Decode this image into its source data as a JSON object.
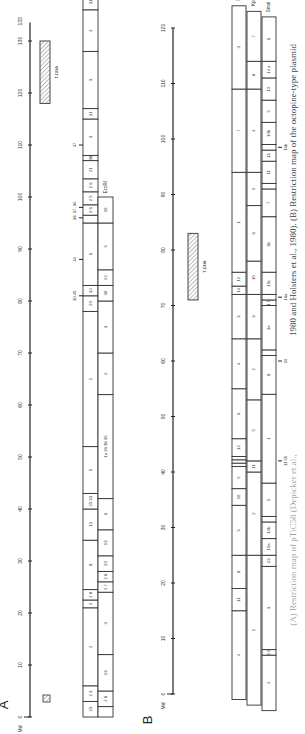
{
  "figure": {
    "orientation": "rotated-90-ccw",
    "caption": "1980 and Holsters et al., 1980). (B) Restriction map of the octopine-type plasmid",
    "caption_lower": "(A) Restriction map of pTiC58 (Depicker et al.,",
    "unit_label": "Md",
    "panels": {
      "A": {
        "label": "A",
        "axis": {
          "min": 0,
          "max": 133,
          "ticks": [
            0,
            10,
            20,
            30,
            40,
            50,
            60,
            70,
            80,
            90,
            100,
            110,
            120,
            130
          ],
          "end_label": "133",
          "zero_y": 717,
          "px_per_unit": 5.2,
          "x": 30
        },
        "tdna": {
          "label": "T-DNA",
          "start": 118,
          "end": 130
        },
        "legend_hatch": true,
        "enzymes": [
          {
            "name": "HindIII",
            "x": 83,
            "w": 15,
            "fragments": [
              {
                "s": 0,
                "e": 3,
                "l": "23"
              },
              {
                "s": 3,
                "e": 6,
                "l": "2 3"
              },
              {
                "s": 6,
                "e": 21,
                "l": "2"
              },
              {
                "s": 21,
                "e": 22.5,
                "l": "2"
              },
              {
                "s": 22.5,
                "e": 24.5,
                "l": "2 8"
              },
              {
                "s": 24.5,
                "e": 34,
                "l": "8"
              },
              {
                "s": 34,
                "e": 40,
                "l": "13"
              },
              {
                "s": 40,
                "e": 43,
                "l": "25 33"
              },
              {
                "s": 43,
                "e": 52,
                "l": "5"
              },
              {
                "s": 52,
                "e": 78,
                "l": "1"
              },
              {
                "s": 78,
                "e": 81,
                "l": "20"
              },
              {
                "s": 81,
                "e": 83,
                "l": "34"
              },
              {
                "s": 83,
                "e": 95,
                "l": "6"
              },
              {
                "s": 95,
                "e": 96.5,
                "l": ""
              },
              {
                "s": 96.5,
                "e": 98.5,
                "l": "2 6"
              },
              {
                "s": 98.5,
                "e": 101,
                "l": "2 5"
              },
              {
                "s": 101,
                "e": 103.5,
                "l": "2 6"
              },
              {
                "s": 103.5,
                "e": 107,
                "l": "21"
              },
              {
                "s": 107,
                "e": 108,
                "l": "38"
              },
              {
                "s": 108,
                "e": 115,
                "l": "3"
              },
              {
                "s": 115,
                "e": 117,
                "l": "31"
              },
              {
                "s": 117,
                "e": 128,
                "l": "3"
              },
              {
                "s": 128,
                "e": 136,
                "l": "4"
              },
              {
                "s": 136,
                "e": 139,
                "l": "31"
              },
              {
                "s": 139,
                "e": 142,
                "l": ""
              }
            ]
          },
          {
            "name": "EcoRI",
            "x": 98,
            "w": 15,
            "fragments": [
              {
                "s": 0,
                "e": 2,
                "l": ""
              },
              {
                "s": 2,
                "e": 5,
                "l": "2 8"
              },
              {
                "s": 5,
                "e": 12,
                "l": "13"
              },
              {
                "s": 12,
                "e": 24,
                "l": "3"
              },
              {
                "s": 24,
                "e": 26,
                "l": "2 7"
              },
              {
                "s": 26,
                "e": 28,
                "l": "2 8"
              },
              {
                "s": 28,
                "e": 31,
                "l": "20"
              },
              {
                "s": 31,
                "e": 36,
                "l": "13"
              },
              {
                "s": 36,
                "e": 42,
                "l": "6"
              },
              {
                "s": 42,
                "e": 62,
                "l": "1a 28 38 35"
              },
              {
                "s": 62,
                "e": 70,
                "l": "4"
              },
              {
                "s": 70,
                "e": 80,
                "l": "3"
              },
              {
                "s": 80,
                "e": 83,
                "l": "30"
              },
              {
                "s": 83,
                "e": 86,
                "l": "22"
              },
              {
                "s": 86,
                "e": 95,
                "l": "5"
              },
              {
                "s": 95,
                "e": 100,
                "l": "10"
              }
            ]
          }
        ],
        "annotations": [
          {
            "text": "38",
            "at": 96
          },
          {
            "text": "30 40",
            "at": 81
          },
          {
            "text": "34",
            "at": 88
          },
          {
            "text": "37",
            "at": 110
          },
          {
            "text": "37, 39",
            "at": 98
          }
        ]
      },
      "B": {
        "label": "B",
        "axis": {
          "min": 0,
          "max": 120,
          "ticks": [
            0,
            10,
            20,
            30,
            40,
            50,
            60,
            70,
            80,
            90,
            100,
            110,
            120
          ],
          "zero_y": 694,
          "px_per_unit": 5.55,
          "x": 173
        },
        "tdna": {
          "label": "T-DNA",
          "start": 71,
          "end": 83
        },
        "enzymes": [
          {
            "name": "HpaI",
            "x": 232,
            "w": 14,
            "fragments": [
              {
                "s": -1,
                "e": 15,
                "l": "4"
              },
              {
                "s": 15,
                "e": 19,
                "l": "11"
              },
              {
                "s": 19,
                "e": 25,
                "l": "8"
              },
              {
                "s": 25,
                "e": 34,
                "l": "5"
              },
              {
                "s": 34,
                "e": 37,
                "l": "10"
              },
              {
                "s": 37,
                "e": 41,
                "l": "9"
              },
              {
                "s": 41,
                "e": 41.6,
                "l": ""
              },
              {
                "s": 41.6,
                "e": 42.2,
                "l": ""
              },
              {
                "s": 42.2,
                "e": 42.8,
                "l": ""
              },
              {
                "s": 42.8,
                "e": 46,
                "l": "12"
              },
              {
                "s": 46,
                "e": 55,
                "l": "6"
              },
              {
                "s": 55,
                "e": 64,
                "l": "4"
              },
              {
                "s": 64,
                "e": 72,
                "l": "3"
              },
              {
                "s": 72,
                "e": 73.5,
                "l": "14"
              },
              {
                "s": 73.5,
                "e": 76,
                "l": "12"
              },
              {
                "s": 76,
                "e": 94,
                "l": "1"
              },
              {
                "s": 94,
                "e": 109,
                "l": "7"
              },
              {
                "s": 109,
                "e": 124,
                "l": "3"
              }
            ]
          },
          {
            "name": "KpnI",
            "x": 247,
            "w": 14,
            "fragments": [
              {
                "s": -2,
                "e": 25,
                "l": "1"
              },
              {
                "s": 25,
                "e": 40,
                "l": "2"
              },
              {
                "s": 40,
                "e": 42,
                "l": "11"
              },
              {
                "s": 42,
                "e": 53,
                "l": "5"
              },
              {
                "s": 53,
                "e": 64,
                "l": "2"
              },
              {
                "s": 64,
                "e": 72,
                "l": "3"
              },
              {
                "s": 72,
                "e": 78,
                "l": "10"
              },
              {
                "s": 78,
                "e": 88,
                "l": "6"
              },
              {
                "s": 88,
                "e": 94,
                "l": "9"
              },
              {
                "s": 94,
                "e": 109,
                "l": "4"
              },
              {
                "s": 109,
                "e": 114,
                "l": "8"
              },
              {
                "s": 114,
                "e": 123,
                "l": "7"
              }
            ]
          },
          {
            "name": "SmaI",
            "x": 262,
            "w": 14,
            "fragments": [
              {
                "s": -3,
                "e": 7,
                "l": "4"
              },
              {
                "s": 7,
                "e": 8,
                "l": "1 8"
              },
              {
                "s": 8,
                "e": 23,
                "l": "3"
              },
              {
                "s": 23,
                "e": 25,
                "l": "13"
              },
              {
                "s": 25,
                "e": 28,
                "l": "10a"
              },
              {
                "s": 28,
                "e": 31,
                "l": "14b"
              },
              {
                "s": 31,
                "e": 32,
                "l": ""
              },
              {
                "s": 32,
                "e": 38,
                "l": "5"
              },
              {
                "s": 38,
                "e": 54,
                "l": "1"
              },
              {
                "s": 54,
                "e": 61,
                "l": "8"
              },
              {
                "s": 61,
                "e": 62,
                "l": ""
              },
              {
                "s": 62,
                "e": 70,
                "l": "3a"
              },
              {
                "s": 70,
                "e": 71,
                "l": "1 5"
              },
              {
                "s": 71,
                "e": 72,
                "l": ""
              },
              {
                "s": 72,
                "e": 76,
                "l": "10c"
              },
              {
                "s": 76,
                "e": 86,
                "l": "3b"
              },
              {
                "s": 86,
                "e": 91,
                "l": "7"
              },
              {
                "s": 91,
                "e": 92,
                "l": ""
              },
              {
                "s": 92,
                "e": 96,
                "l": "11"
              },
              {
                "s": 96,
                "e": 98,
                "l": "13"
              },
              {
                "s": 98,
                "e": 99,
                "l": ""
              },
              {
                "s": 99,
                "e": 103,
                "l": "10b"
              },
              {
                "s": 103,
                "e": 107,
                "l": "9"
              },
              {
                "s": 107,
                "e": 111,
                "l": "12"
              },
              {
                "s": 111,
                "e": 114,
                "l": "14 a"
              },
              {
                "s": 114,
                "e": 122,
                "l": "6"
              }
            ]
          }
        ],
        "annotations": [
          {
            "text": "19",
            "at": 60
          },
          {
            "text": "16a",
            "at": 71.5
          },
          {
            "text": "16b",
            "at": 98.5
          },
          {
            "text": "11 55",
            "at": 42
          }
        ]
      }
    }
  }
}
